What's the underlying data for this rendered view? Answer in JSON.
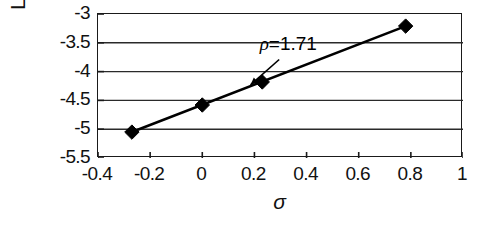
{
  "chart_data": {
    "type": "scatter",
    "title": "",
    "subtitle": "",
    "xlabel": "σ",
    "ylabel_parts": {
      "prefix": "Log ",
      "italic": "k",
      "suffix_open": " (s",
      "superscript": "-1",
      "suffix_close": ")"
    },
    "ylabel": "Log k (s-1)",
    "xlim": [
      -0.4,
      1.0
    ],
    "ylim": [
      -5.5,
      -3.0
    ],
    "xticks": [
      -0.4,
      -0.2,
      0,
      0.2,
      0.4,
      0.6,
      0.8,
      1
    ],
    "xtick_labels": [
      "-0.4",
      "-0.2",
      "0",
      "0.2",
      "0.4",
      "0.6",
      "0.8",
      "1"
    ],
    "yticks": [
      -3,
      -3.5,
      -4,
      -4.5,
      -5,
      -5.5
    ],
    "ytick_labels": [
      "-3",
      "-3.5",
      "-4",
      "-4.5",
      "-5",
      "-5.5"
    ],
    "grid": {
      "horizontal": true,
      "vertical": false
    },
    "legend": {
      "visible": false,
      "position": "none"
    },
    "series": [
      {
        "name": "Hammett correlation",
        "marker": "filled-diamond",
        "marker_color": "#000000",
        "line_color": "#000000",
        "x": [
          -0.27,
          0.0,
          0.23,
          0.78
        ],
        "y": [
          -5.05,
          -4.58,
          -4.18,
          -3.21
        ]
      }
    ],
    "fit_line": {
      "x": [
        -0.27,
        0.78
      ],
      "y": [
        -5.05,
        -3.21
      ],
      "slope": 1.71
    },
    "annotations": [
      {
        "text_parts": {
          "symbol": "ρ",
          "rest": "=1.71"
        },
        "text": "ρ=1.71",
        "x": 0.33,
        "y": -3.62,
        "arrow": {
          "from_x": 0.295,
          "from_y": -3.79,
          "to_x": 0.185,
          "to_y": -4.23
        }
      }
    ]
  },
  "axes": {
    "frame_color": "#1a1a1a",
    "gridline_color": "#2a2a2a",
    "background": "#ffffff"
  }
}
